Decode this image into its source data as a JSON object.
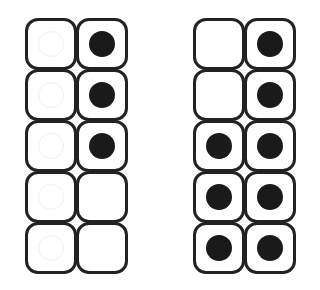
{
  "colors": {
    "stroke": "#222222",
    "counter": "#1a1a1a",
    "ghost": "#f0f0f0"
  },
  "frames": [
    {
      "name": "ten-frame-left",
      "x": 25,
      "filled_count": 3,
      "cells": [
        [
          {
            "filled": false,
            "ghost": true
          },
          {
            "filled": true
          }
        ],
        [
          {
            "filled": false,
            "ghost": true
          },
          {
            "filled": true
          }
        ],
        [
          {
            "filled": false,
            "ghost": true
          },
          {
            "filled": true
          }
        ],
        [
          {
            "filled": false,
            "ghost": true
          },
          {
            "filled": false
          }
        ],
        [
          {
            "filled": false,
            "ghost": true
          },
          {
            "filled": false
          }
        ]
      ]
    },
    {
      "name": "ten-frame-right",
      "x": 193,
      "filled_count": 8,
      "cells": [
        [
          {
            "filled": false
          },
          {
            "filled": true
          }
        ],
        [
          {
            "filled": false
          },
          {
            "filled": true
          }
        ],
        [
          {
            "filled": true
          },
          {
            "filled": true
          }
        ],
        [
          {
            "filled": true
          },
          {
            "filled": true
          }
        ],
        [
          {
            "filled": true
          },
          {
            "filled": true
          }
        ]
      ]
    }
  ]
}
